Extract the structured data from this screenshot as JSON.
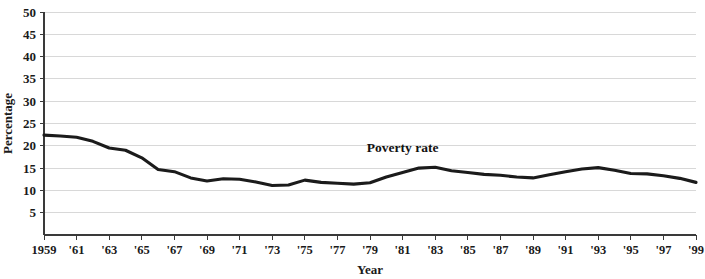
{
  "chart_data": {
    "type": "line",
    "title": "",
    "xlabel": "Year",
    "ylabel": "Percentage",
    "ylim": [
      0,
      50
    ],
    "xlim": [
      1959,
      1999
    ],
    "grid": true,
    "legend_position": "inline-annotation",
    "y_ticks": [
      5,
      10,
      15,
      20,
      25,
      30,
      35,
      40,
      45,
      50
    ],
    "y_tick_labels": [
      "5",
      "10",
      "15",
      "20",
      "25",
      "30",
      "35",
      "40",
      "45",
      "50"
    ],
    "x_ticks": [
      1959,
      1961,
      1963,
      1965,
      1967,
      1969,
      1971,
      1973,
      1975,
      1977,
      1979,
      1981,
      1983,
      1985,
      1987,
      1989,
      1991,
      1993,
      1995,
      1997,
      1999
    ],
    "x_tick_labels": [
      "1959",
      "'61",
      "'63",
      "'65",
      "'67",
      "'69",
      "'71",
      "'73",
      "'75",
      "'77",
      "'79",
      "'81",
      "'83",
      "'85",
      "'87",
      "'89",
      "'91",
      "'93",
      "'95",
      "'97",
      "'99"
    ],
    "annotations": [
      {
        "text": "Poverty rate",
        "x": 1981.0,
        "y": 18.6
      }
    ],
    "series": [
      {
        "name": "Poverty rate",
        "color": "#1b1b1b",
        "x": [
          1959,
          1960,
          1961,
          1962,
          1963,
          1964,
          1965,
          1966,
          1967,
          1968,
          1969,
          1970,
          1971,
          1972,
          1973,
          1974,
          1975,
          1976,
          1977,
          1978,
          1979,
          1980,
          1981,
          1982,
          1983,
          1984,
          1985,
          1986,
          1987,
          1988,
          1989,
          1990,
          1991,
          1992,
          1993,
          1994,
          1995,
          1996,
          1997,
          1998,
          1999
        ],
        "values": [
          22.4,
          22.2,
          21.9,
          21.0,
          19.5,
          19.0,
          17.3,
          14.7,
          14.2,
          12.8,
          12.1,
          12.6,
          12.5,
          11.9,
          11.1,
          11.2,
          12.3,
          11.8,
          11.6,
          11.4,
          11.7,
          13.0,
          14.0,
          15.0,
          15.2,
          14.4,
          14.0,
          13.6,
          13.4,
          13.0,
          12.8,
          13.5,
          14.2,
          14.8,
          15.1,
          14.5,
          13.8,
          13.7,
          13.3,
          12.7,
          11.8
        ]
      }
    ]
  }
}
